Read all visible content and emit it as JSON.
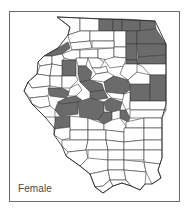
{
  "figure": {
    "label": "Female",
    "colors": {
      "shaded": "#6b6b6b",
      "unshaded": "#ffffff",
      "border": "#3a3a3a",
      "frame": "#6a6a6a"
    },
    "legend": null
  },
  "map": {
    "region": "Illinois counties",
    "outline": "57,17 155,21 158,27 166,44 166,75 166,104 162,118 162,158 160,164 158,170 161,178 152,184 145,184 140,190 131,186 122,183 113,186 103,193 95,187 90,174 80,166 66,156 62,146 54,135 55,129 45,117 32,104 24,91 28,82 37,74 38,62 44,56 58,48 68,35 70,27",
    "counties": [
      {
        "shaded": false,
        "points": "57,17 80,18 80,31 68,35 70,27"
      },
      {
        "shaded": false,
        "points": "80,18 99,19 99,31 80,31"
      },
      {
        "shaded": true,
        "points": "99,19 113,19 113,31 99,31"
      },
      {
        "shaded": true,
        "points": "113,19 122,19 122,31 113,31"
      },
      {
        "shaded": true,
        "points": "122,19 140,20 140,31 122,31"
      },
      {
        "shaded": true,
        "points": "140,20 155,21 156,29 140,31"
      },
      {
        "shaded": false,
        "points": "68,35 80,31 90,31 90,41 70,43"
      },
      {
        "shaded": false,
        "points": "90,31 114,31 114,41 90,41"
      },
      {
        "shaded": false,
        "points": "114,31 126,31 126,47 114,47"
      },
      {
        "shaded": true,
        "points": "126,31 137,31 137,44 126,44"
      },
      {
        "shaded": true,
        "points": "137,31 156,29 166,44 137,44"
      },
      {
        "shaded": false,
        "points": "70,43 90,41 92,48 72,50"
      },
      {
        "shaded": false,
        "points": "92,41 114,41 114,48 92,48"
      },
      {
        "shaded": true,
        "points": "44,56 58,48 68,42 70,48 62,54 52,56"
      },
      {
        "shaded": false,
        "points": "62,54 72,50 80,50 80,58 72,60 64,58"
      },
      {
        "shaded": false,
        "points": "80,50 98,49 98,58 80,58"
      },
      {
        "shaded": false,
        "points": "98,49 114,48 114,57 108,60 98,58"
      },
      {
        "shaded": false,
        "points": "114,47 126,47 126,58 114,57"
      },
      {
        "shaded": true,
        "points": "126,44 137,44 137,60 126,60"
      },
      {
        "shaded": true,
        "points": "137,44 166,44 166,55 138,57"
      },
      {
        "shaded": true,
        "points": "138,57 166,55 166,64 137,64"
      },
      {
        "shaded": true,
        "points": "126,60 137,60 137,64 126,64"
      },
      {
        "shaded": false,
        "points": "38,62 44,56 52,56 52,64 40,66"
      },
      {
        "shaded": false,
        "points": "52,56 62,54 64,58 62,66 52,64"
      },
      {
        "shaded": true,
        "points": "62,60 76,60 76,76 62,76"
      },
      {
        "shaded": false,
        "points": "76,58 88,58 86,66 78,66"
      },
      {
        "shaded": true,
        "points": "78,66 86,66 92,72 90,80 80,82 78,74"
      },
      {
        "shaded": false,
        "points": "88,58 98,58 104,62 100,68 92,68"
      },
      {
        "shaded": false,
        "points": "92,68 100,68 106,66 108,72 96,74"
      },
      {
        "shaded": false,
        "points": "104,60 114,57 126,58 124,66 110,68"
      },
      {
        "shaded": false,
        "points": "124,64 137,64 137,72 128,80 120,74"
      },
      {
        "shaded": false,
        "points": "137,64 166,64 166,75 150,75 142,66"
      },
      {
        "shaded": false,
        "points": "37,74 40,66 52,64 50,76"
      },
      {
        "shaded": false,
        "points": "50,76 52,64 62,66 62,76"
      },
      {
        "shaded": false,
        "points": "28,82 37,74 50,76 50,86 32,88"
      },
      {
        "shaded": false,
        "points": "50,76 62,76 62,88 50,86"
      },
      {
        "shaded": false,
        "points": "62,76 76,76 78,80 70,88 62,88"
      },
      {
        "shaded": true,
        "points": "80,82 90,80 102,84 104,90 90,92"
      },
      {
        "shaded": false,
        "points": "96,74 108,72 114,76 104,82 90,80"
      },
      {
        "shaded": true,
        "points": "104,82 114,76 128,80 132,88 124,94 106,92"
      },
      {
        "shaded": false,
        "points": "128,80 137,72 150,75 150,84 132,88"
      },
      {
        "shaded": true,
        "points": "130,84 150,84 150,101 130,101"
      },
      {
        "shaded": true,
        "points": "150,75 166,75 166,101 150,101"
      },
      {
        "shaded": false,
        "points": "24,91 28,82 32,88 50,86 48,96 30,98"
      },
      {
        "shaded": true,
        "points": "48,88 62,88 70,92 66,98 50,96"
      },
      {
        "shaded": false,
        "points": "70,88 78,84 82,90 76,96 68,96"
      },
      {
        "shaded": true,
        "points": "90,92 104,90 108,98 96,100 90,98"
      },
      {
        "shaded": false,
        "points": "106,92 124,94 124,100 112,98"
      },
      {
        "shaded": false,
        "points": "124,94 130,92 130,108 126,110 122,102"
      },
      {
        "shaded": false,
        "points": "32,104 30,98 48,96 50,106 40,108"
      },
      {
        "shaded": true,
        "points": "66,98 76,96 82,100 78,102 62,104 58,102"
      },
      {
        "shaded": true,
        "points": "58,102 62,104 78,102 78,114 60,116 55,110"
      },
      {
        "shaded": true,
        "points": "78,102 90,98 104,102 104,114 98,120 80,118"
      },
      {
        "shaded": true,
        "points": "104,102 110,98 122,102 120,110 112,112 106,110"
      },
      {
        "shaded": true,
        "points": "98,120 104,112 112,112 112,120 104,124"
      },
      {
        "shaded": true,
        "points": "120,110 126,110 130,118 128,122 120,118"
      },
      {
        "shaded": false,
        "points": "130,101 166,101 166,110 130,110"
      },
      {
        "shaded": false,
        "points": "130,110 166,110 162,118 144,118 130,118"
      },
      {
        "shaded": false,
        "points": "45,117 32,104 40,108 50,106 55,110 55,117"
      },
      {
        "shaded": true,
        "points": "55,117 70,116 70,127 54,129 55,122"
      },
      {
        "shaded": false,
        "points": "70,116 88,118 88,130 70,130"
      },
      {
        "shaded": false,
        "points": "88,118 104,124 104,130 88,130"
      },
      {
        "shaded": false,
        "points": "104,124 112,120 120,118 126,126 124,132 104,130"
      },
      {
        "shaded": false,
        "points": "126,122 144,118 144,128 126,128"
      },
      {
        "shaded": false,
        "points": "144,118 162,118 162,128 144,128"
      },
      {
        "shaded": false,
        "points": "54,135 54,129 70,127 70,138 62,140"
      },
      {
        "shaded": false,
        "points": "70,130 88,130 88,140 70,140"
      },
      {
        "shaded": false,
        "points": "88,130 106,130 106,140 88,140"
      },
      {
        "shaded": false,
        "points": "106,130 124,132 124,142 106,140"
      },
      {
        "shaded": false,
        "points": "124,128 144,128 144,140 124,142"
      },
      {
        "shaded": false,
        "points": "144,128 162,128 162,140 144,140"
      },
      {
        "shaded": false,
        "points": "62,146 62,140 70,140 88,140 86,150 68,152"
      },
      {
        "shaded": false,
        "points": "88,140 106,140 108,150 86,150"
      },
      {
        "shaded": false,
        "points": "106,140 124,142 124,150 108,150"
      },
      {
        "shaded": false,
        "points": "124,142 144,140 144,150 124,150"
      },
      {
        "shaded": false,
        "points": "144,140 162,140 162,150 144,150"
      },
      {
        "shaded": false,
        "points": "66,156 68,152 86,150 88,158 80,166"
      },
      {
        "shaded": false,
        "points": "88,150 108,150 108,160 88,160"
      },
      {
        "shaded": false,
        "points": "108,150 124,150 124,160 108,160"
      },
      {
        "shaded": false,
        "points": "124,150 144,150 144,160 124,160"
      },
      {
        "shaded": false,
        "points": "144,150 162,150 162,158 160,164 144,162"
      },
      {
        "shaded": false,
        "points": "80,166 88,158 108,160 108,170 90,174"
      },
      {
        "shaded": false,
        "points": "108,160 124,160 124,170 108,170"
      },
      {
        "shaded": false,
        "points": "124,160 144,162 146,172 124,170"
      },
      {
        "shaded": false,
        "points": "144,162 160,164 158,170 161,178 152,184 146,172"
      },
      {
        "shaded": false,
        "points": "90,174 108,170 110,180 103,186 95,187"
      },
      {
        "shaded": false,
        "points": "108,170 124,170 126,180 110,180"
      },
      {
        "shaded": false,
        "points": "124,170 146,172 145,184 140,190 131,186 126,180"
      },
      {
        "shaded": false,
        "points": "95,187 103,186 110,180 113,186 103,193"
      },
      {
        "shaded": false,
        "points": "110,180 126,180 131,186 122,183 113,186"
      }
    ]
  }
}
